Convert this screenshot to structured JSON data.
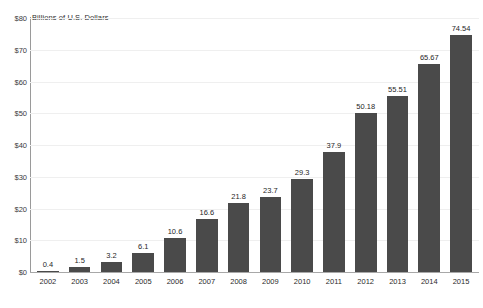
{
  "chart_data": {
    "type": "bar",
    "title": "",
    "subtitle": "",
    "axis_note": "Billions of U.S. Dollars",
    "xlabel": "",
    "ylabel": "Billions of U.S. Dollars",
    "categories": [
      "2002",
      "2003",
      "2004",
      "2005",
      "2006",
      "2007",
      "2008",
      "2009",
      "2010",
      "2011",
      "2012",
      "2013",
      "2014",
      "2015"
    ],
    "values": [
      0.4,
      1.5,
      3.2,
      6.1,
      10.6,
      16.6,
      21.8,
      23.7,
      29.3,
      37.9,
      50.18,
      55.51,
      65.67,
      74.54
    ],
    "value_labels": [
      "0.4",
      "1.5",
      "3.2",
      "6.1",
      "10.6",
      "16.6",
      "21.8",
      "23.7",
      "29.3",
      "37.9",
      "50.18",
      "55.51",
      "65.67",
      "74.54"
    ],
    "ylim": [
      0,
      80
    ],
    "ytick_values": [
      80,
      70,
      60,
      50,
      40,
      30,
      20,
      10,
      0
    ],
    "ytick_labels": [
      "$80",
      "$70",
      "$60",
      "$50",
      "$40",
      "$30",
      "$20",
      "$10",
      "$0"
    ],
    "grid": true,
    "legend": null,
    "legend_position": "none",
    "series": [
      {
        "name": "Billions of U.S. Dollars",
        "color": "#4a4a4a",
        "values": [
          0.4,
          1.5,
          3.2,
          6.1,
          10.6,
          16.6,
          21.8,
          23.7,
          29.3,
          37.9,
          50.18,
          55.51,
          65.67,
          74.54
        ]
      }
    ],
    "colors": {
      "bar": "#4a4a4a",
      "gridline": "#efefef",
      "axis": "#9a9a9a",
      "baseline": "#a8a8a8",
      "text": "#2b2b2b",
      "background": "#ffffff"
    }
  }
}
